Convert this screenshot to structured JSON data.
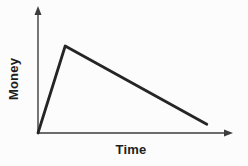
{
  "chart_data": {
    "type": "line",
    "title": "",
    "xlabel": "Time",
    "ylabel": "Money",
    "xlim": [
      0,
      1
    ],
    "ylim": [
      0,
      1
    ],
    "x_ticks": [],
    "y_ticks": [],
    "grid": false,
    "legend": null,
    "axis_style": "arrow-tipped, no tick marks, qualitative sketch",
    "series": [
      {
        "name": "money-over-time",
        "shape": "sharp rise from origin to early peak, then long gradual decline",
        "points": [
          {
            "x": 0.0,
            "y": 0.0
          },
          {
            "x": 0.14,
            "y": 1.0
          },
          {
            "x": 0.87,
            "y": 0.1
          }
        ]
      }
    ]
  },
  "colors": {
    "background": "#fcfcfc",
    "axis": "#3d3d3d",
    "line": "#252525",
    "label": "#1e1e1e"
  }
}
